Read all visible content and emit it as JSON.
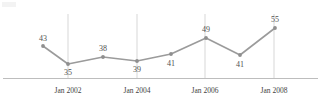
{
  "chart_data": {
    "type": "line",
    "title": "",
    "subtitle": "",
    "xlabel": "",
    "ylabel": "",
    "grid": "vertical-only",
    "legend": "none",
    "x": [
      "Jan 2001",
      "Jan 2002",
      "Jan 2003",
      "Jan 2004",
      "Jan 2005",
      "Jan 2006",
      "Jan 2007",
      "Jan 2008"
    ],
    "values": [
      43,
      35,
      38,
      39,
      41,
      49,
      41,
      55
    ],
    "point_labels": [
      "43",
      "35",
      "38",
      "39",
      "41",
      "49",
      "41",
      "55"
    ],
    "label_positions": [
      "above",
      "below",
      "above",
      "below",
      "above",
      "above",
      "below",
      "above"
    ],
    "tick_labels": [
      "Jan 2002",
      "Jan 2004",
      "Jan 2006",
      "Jan 2008"
    ],
    "ylim": [
      30,
      58
    ],
    "series": [
      {
        "name": "series-1",
        "values": [
          43,
          35,
          38,
          39,
          41,
          49,
          41,
          55
        ]
      }
    ],
    "colors": {
      "line": "#9b9b9b",
      "marker": "#8f8f8f",
      "gridline": "#d7d7d7",
      "axis": "#bdbdbd",
      "value_label": "#4f4f4f",
      "tick_label": "#3f3f3f",
      "background": "#ffffff"
    },
    "geometry": {
      "point_x": [
        43,
        68,
        103,
        137,
        171,
        206,
        240,
        275
      ],
      "point_y": [
        46,
        64,
        57,
        61,
        54,
        38,
        55,
        28
      ],
      "gridline_x": [
        68,
        137,
        205,
        274
      ],
      "gridline_top": 14,
      "gridline_bottom": 78,
      "axis_y": 78.5,
      "axis_x_start": 3,
      "axis_x_end": 318,
      "tick_label_x": [
        68,
        137,
        205,
        274
      ],
      "tick_label_y": 93,
      "value_label_xy": [
        [
          43,
          41
        ],
        [
          68,
          75
        ],
        [
          103,
          51
        ],
        [
          137,
          72
        ],
        [
          171,
          66
        ],
        [
          206,
          32
        ],
        [
          240,
          67
        ],
        [
          275,
          22
        ]
      ]
    }
  }
}
